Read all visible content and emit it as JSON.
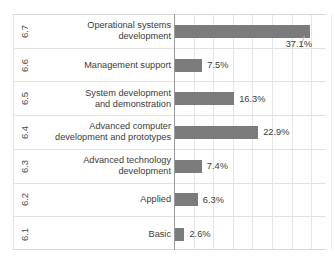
{
  "chart_data": {
    "type": "bar",
    "orientation": "horizontal",
    "title": "",
    "xlabel": "",
    "ylabel": "",
    "grid": true,
    "legend": false,
    "xlim": [
      0,
      42
    ],
    "codes": [
      "6.7",
      "6.6",
      "6.5",
      "6.4",
      "6.3",
      "6.2",
      "6.1"
    ],
    "categories": [
      "Operational systems development",
      "Management support",
      "System development and demonstration",
      "Advanced computer development and prototypes",
      "Advanced technology development",
      "Applied",
      "Basic"
    ],
    "values": [
      37.1,
      7.5,
      16.3,
      22.9,
      7.4,
      6.3,
      2.6
    ],
    "value_labels": [
      "37.1%",
      "7.5%",
      "16.3%",
      "22.9%",
      "7.4%",
      "6.3%",
      "2.6%"
    ],
    "bar_color": "#7b7b7b",
    "grid_color": "#e6e6e6",
    "axis_color": "#9a9a9a"
  },
  "rows": [
    {
      "code": "6.7",
      "label_line1": "Operational systems",
      "label_line2": "development",
      "value": 37.1,
      "value_label": "37.1%",
      "callout": true
    },
    {
      "code": "6.6",
      "label_line1": "Management support",
      "label_line2": "",
      "value": 7.5,
      "value_label": "7.5%",
      "callout": false
    },
    {
      "code": "6.5",
      "label_line1": "System development",
      "label_line2": "and demonstration",
      "value": 16.3,
      "value_label": "16.3%",
      "callout": false
    },
    {
      "code": "6.4",
      "label_line1": "Advanced computer",
      "label_line2": "development and prototypes",
      "value": 22.9,
      "value_label": "22.9%",
      "callout": false
    },
    {
      "code": "6.3",
      "label_line1": "Advanced technology",
      "label_line2": "development",
      "value": 7.4,
      "value_label": "7.4%",
      "callout": false
    },
    {
      "code": "6.2",
      "label_line1": "Applied",
      "label_line2": "",
      "value": 6.3,
      "value_label": "6.3%",
      "callout": false
    },
    {
      "code": "6.1",
      "label_line1": "Basic",
      "label_line2": "",
      "value": 2.6,
      "value_label": "2.6%",
      "callout": false
    }
  ]
}
